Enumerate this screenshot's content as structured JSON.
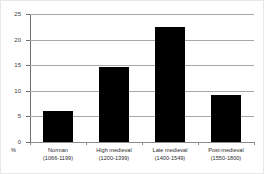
{
  "chart_data": {
    "type": "bar",
    "title": "",
    "subtitle": "",
    "xlabel": "",
    "ylabel": "%",
    "unit_label": "%",
    "categories": [
      "Norman",
      "High medieval",
      "Late medieval",
      "Post-medieval"
    ],
    "category_ranges": [
      "(1066-1199)",
      "(1200-1399)",
      "(1400-1549)",
      "(1550-1800)"
    ],
    "values": [
      6.1,
      14.7,
      22.4,
      9.2
    ],
    "ylim": [
      0,
      25
    ],
    "yticks": [
      0,
      5,
      10,
      15,
      20,
      25
    ],
    "ytick_labels": [
      "0",
      "5",
      "10",
      "15",
      "20",
      "25"
    ],
    "grid": true,
    "grid_axis": "y",
    "legend": false,
    "legend_position": "none",
    "bar_color": "#000000",
    "grid_color": "#a8a8a8",
    "axis_color": "#6e6e6e",
    "background_color": "#ffffff"
  }
}
